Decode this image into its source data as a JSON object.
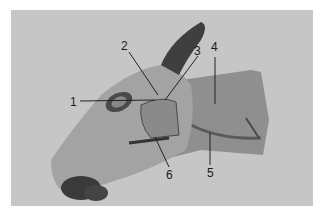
{
  "figure": {
    "labels": [
      {
        "id": "1",
        "text": "1"
      },
      {
        "id": "2",
        "text": "2"
      },
      {
        "id": "3",
        "text": "3"
      },
      {
        "id": "4",
        "text": "4"
      },
      {
        "id": "5",
        "text": "5"
      },
      {
        "id": "6",
        "text": "6"
      }
    ],
    "caption": "",
    "colors": {
      "background": "#c6c6c6",
      "specimen": "#9a9a9a",
      "dark_tissue": "#3a3a3a",
      "leader_line": "#222222"
    }
  }
}
